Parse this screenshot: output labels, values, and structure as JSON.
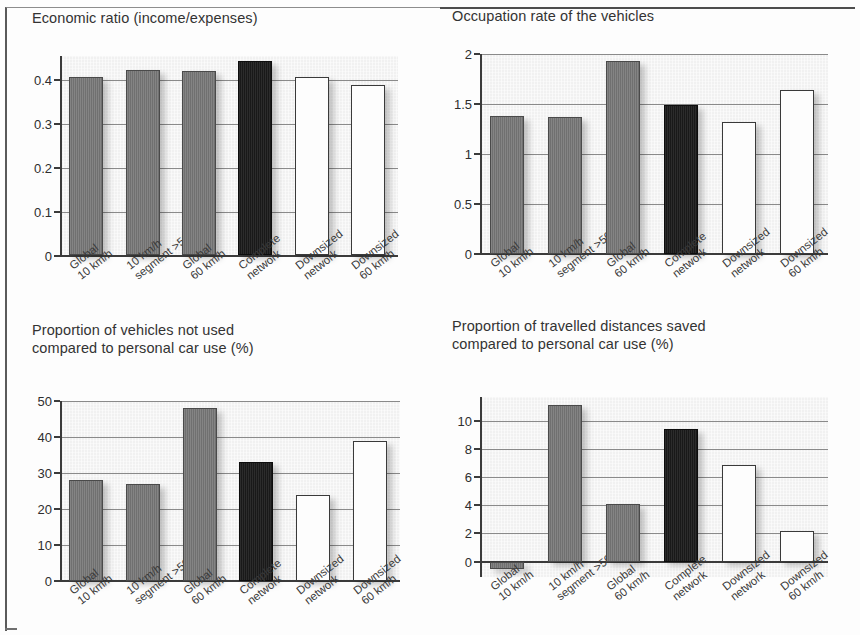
{
  "page": {
    "kind": "scanned-figure-page",
    "background_color": "#fdfdfd",
    "frame_color": "#5a5a5a"
  },
  "palette": {
    "bar_dark_gray": "#767676",
    "bar_black": "#1c1c1c",
    "bar_white": "#fdfdfd",
    "plot_background": "#f1f1f1",
    "gridline": "#8a8a8a",
    "axis": "#3b3b3b",
    "text": "#2e2e2e"
  },
  "categories": [
    "Global\n10 km/h",
    "10 km/h\nsegment >500 m",
    "Global\n60 km/h",
    "Complete\nnetwork",
    "Downsized\nnetwork",
    "Downsized\n60 km/h"
  ],
  "bar_styles": [
    "dark-gray",
    "dark-gray",
    "dark-gray",
    "black",
    "white",
    "white"
  ],
  "chart_data": [
    {
      "id": "economic-ratio",
      "type": "bar",
      "title": "Economic ratio (income/expenses)",
      "xlabel": "",
      "ylabel": "",
      "categories": [
        "Global\n10 km/h",
        "10 km/h\nsegment >500 m",
        "Global\n60 km/h",
        "Complete\nnetwork",
        "Downsized\nnetwork",
        "Downsized\n60 km/h"
      ],
      "values": [
        0.407,
        0.423,
        0.42,
        0.442,
        0.405,
        0.387
      ],
      "ylim": [
        0,
        0.455
      ],
      "yticks": [
        0,
        0.1,
        0.2,
        0.3,
        0.4
      ],
      "ytick_labels": [
        "0",
        "0.1",
        "0.2",
        "0.3",
        "0.4"
      ],
      "grid": true,
      "legend": "none"
    },
    {
      "id": "occupation-rate",
      "type": "bar",
      "title": "Occupation rate of the vehicles",
      "xlabel": "",
      "ylabel": "",
      "categories": [
        "Global\n10 km/h",
        "10 km/h\nsegment >500 m",
        "Global\n60 km/h",
        "Complete\nnetwork",
        "Downsized\nnetwork",
        "Downsized\n60 km/h"
      ],
      "values": [
        1.38,
        1.37,
        1.93,
        1.49,
        1.32,
        1.64
      ],
      "ylim": [
        0,
        2
      ],
      "yticks": [
        0,
        0.5,
        1,
        1.5,
        2
      ],
      "ytick_labels": [
        "0",
        "0.5",
        "1",
        "1.5",
        "2"
      ],
      "grid": true,
      "legend": "none"
    },
    {
      "id": "vehicles-not-used",
      "type": "bar",
      "title": "Proportion of vehicles not used\ncompared to personal car use (%)",
      "xlabel": "",
      "ylabel": "",
      "categories": [
        "Global\n10 km/h",
        "10 km/h\nsegment >500 m",
        "Global\n60 km/h",
        "Complete\nnetwork",
        "Downsized\nnetwork",
        "Downsized\n60 km/h"
      ],
      "values": [
        28,
        27,
        48,
        33,
        24,
        39
      ],
      "ylim": [
        0,
        50
      ],
      "yticks": [
        0,
        10,
        20,
        30,
        40,
        50
      ],
      "ytick_labels": [
        "0",
        "10",
        "20",
        "30",
        "40",
        "50"
      ],
      "grid": true,
      "legend": "none"
    },
    {
      "id": "travelled-distances-saved",
      "type": "bar",
      "title": "Proportion of travelled distances saved\ncompared to personal car use (%)",
      "xlabel": "",
      "ylabel": "",
      "categories": [
        "Global\n10 km/h",
        "10 km/h\nsegment >500 m",
        "Global\n60 km/h",
        "Complete\nnetwork",
        "Downsized\nnetwork",
        "Downsized\n60 km/h"
      ],
      "values": [
        -0.5,
        11.1,
        4.1,
        9.4,
        6.9,
        2.2
      ],
      "ylim": [
        -1.1,
        11.7
      ],
      "yticks": [
        0,
        2,
        4,
        6,
        8,
        10
      ],
      "ytick_labels": [
        "0",
        "2",
        "4",
        "6",
        "8",
        "10"
      ],
      "grid": true,
      "legend": "none"
    }
  ]
}
